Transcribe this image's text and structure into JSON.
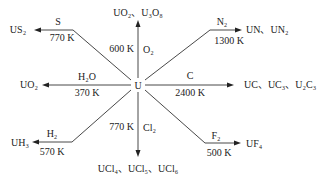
{
  "diagram": {
    "center": {
      "label": "U"
    },
    "branches": [
      {
        "id": "sulfur",
        "reagent": "S",
        "temperature": "770 K",
        "product_parts": [
          [
            "US",
            "2",
            ""
          ]
        ]
      },
      {
        "id": "oxygen",
        "reagent": "O₂",
        "temperature": "600 K",
        "product": "UO₂、U₃O₈"
      },
      {
        "id": "nitrogen",
        "reagent": "N₂",
        "temperature": "1300 K",
        "product": "UN、UN₂"
      },
      {
        "id": "water",
        "reagent": "H₂O",
        "temperature": "370 K",
        "product": "UO₂"
      },
      {
        "id": "carbon",
        "reagent": "C",
        "temperature": "2400 K",
        "product": "UC、UC₃、U₂C₃"
      },
      {
        "id": "hydrogen",
        "reagent": "H₂",
        "temperature": "570 K",
        "product": "UH₃"
      },
      {
        "id": "chlorine",
        "reagent": "Cl₂",
        "temperature": "770 K",
        "product": "UCl₄、UCl₅、UCl₆"
      },
      {
        "id": "fluorine",
        "reagent": "F₂",
        "temperature": "500 K",
        "product": "UF₄"
      }
    ],
    "sulfur_product": "US₂",
    "colors": {
      "line": "#333333",
      "text": "#222222",
      "background": "#ffffff"
    }
  }
}
